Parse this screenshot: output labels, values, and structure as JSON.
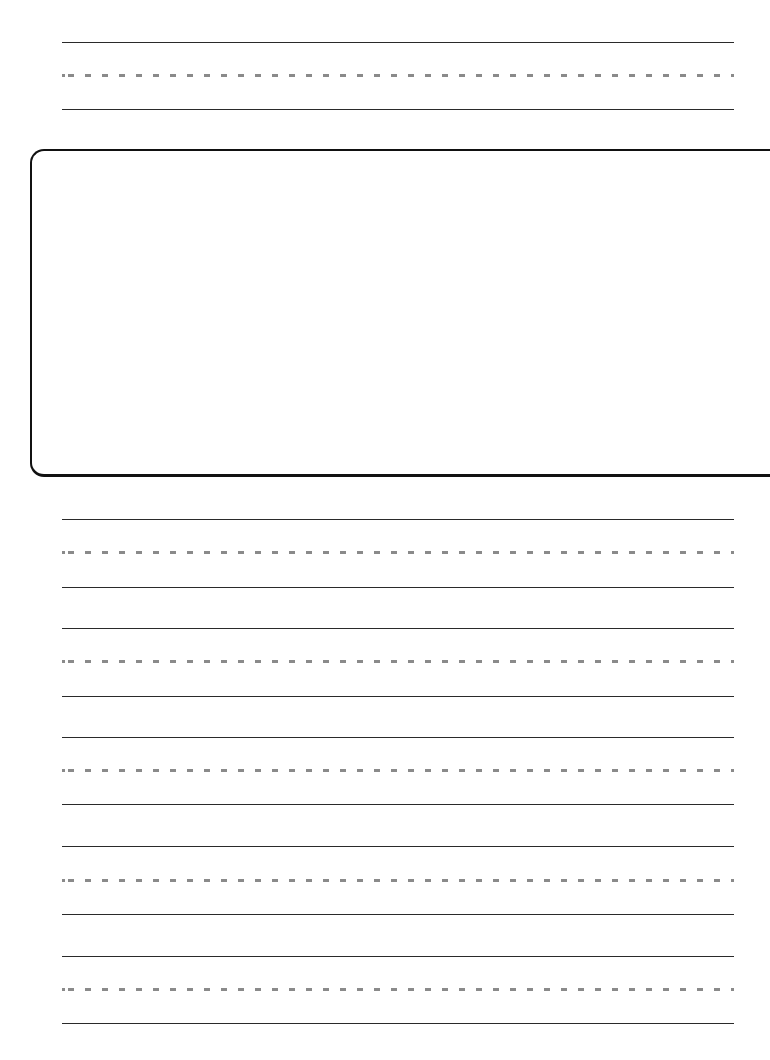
{
  "page": {
    "type": "handwriting-practice-worksheet",
    "background_color": "#ffffff",
    "line_color": "#2a2a2a",
    "midline_color": "#8a8a8a"
  },
  "drawing_box": {
    "content": ""
  },
  "line_sets": [
    {
      "top_y": 42,
      "mid_y": 75,
      "base_y": 109
    },
    {
      "top_y": 519,
      "mid_y": 552,
      "base_y": 587
    },
    {
      "top_y": 628,
      "mid_y": 661,
      "base_y": 696
    },
    {
      "top_y": 737,
      "mid_y": 770,
      "base_y": 804
    },
    {
      "top_y": 846,
      "mid_y": 880,
      "base_y": 914
    },
    {
      "top_y": 956,
      "mid_y": 989,
      "base_y": 1023
    }
  ]
}
